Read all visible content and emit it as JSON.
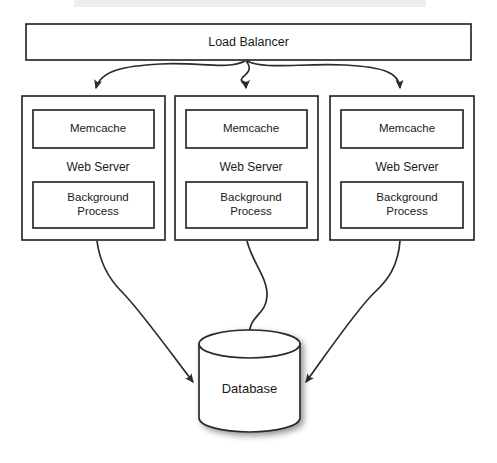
{
  "diagram": {
    "type": "architecture-block-diagram",
    "background_color": "#ffffff",
    "stroke_color": "#2b2b2b",
    "text_color": "#1a1a1a",
    "canvas": {
      "width": 497,
      "height": 463
    },
    "load_balancer": {
      "label": "Load Balancer",
      "x": 26,
      "y": 24,
      "width": 445,
      "height": 36
    },
    "servers": [
      {
        "id": "server-1",
        "x": 22,
        "y": 96,
        "width": 143,
        "height": 144,
        "memcache_label": "Memcache",
        "web_server_label": "Web Server",
        "background_label": "Background\nProcess",
        "background_label_line1": "Background",
        "background_label_line2": "Process"
      },
      {
        "id": "server-2",
        "x": 175,
        "y": 96,
        "width": 143,
        "height": 144,
        "memcache_label": "Memcache",
        "web_server_label": "Web Server",
        "background_label": "Background\nProcess",
        "background_label_line1": "Background",
        "background_label_line2": "Process"
      },
      {
        "id": "server-3",
        "x": 330,
        "y": 96,
        "width": 144,
        "height": 144,
        "memcache_label": "Memcache",
        "web_server_label": "Web Server",
        "background_label": "Background\nProcess",
        "background_label_line1": "Background",
        "background_label_line2": "Process"
      }
    ],
    "database": {
      "label": "Database",
      "x": 199,
      "y": 344,
      "width": 101,
      "height": 88,
      "ellipse_ry": 14
    },
    "connections": {
      "from_load_balancer": [
        {
          "to": "server-1",
          "arrowhead_x": 96,
          "arrowhead_y": 95
        },
        {
          "to": "server-2",
          "arrowhead_x": 246,
          "arrowhead_y": 95
        },
        {
          "to": "server-3",
          "arrowhead_x": 400,
          "arrowhead_y": 95
        }
      ],
      "to_database": [
        {
          "from": "server-1",
          "arrowhead_x": 200,
          "arrowhead_y": 388
        },
        {
          "from": "server-2",
          "arrowhead_x": 249,
          "arrowhead_y": 344
        },
        {
          "from": "server-3",
          "arrowhead_x": 299,
          "arrowhead_y": 388
        }
      ]
    }
  }
}
